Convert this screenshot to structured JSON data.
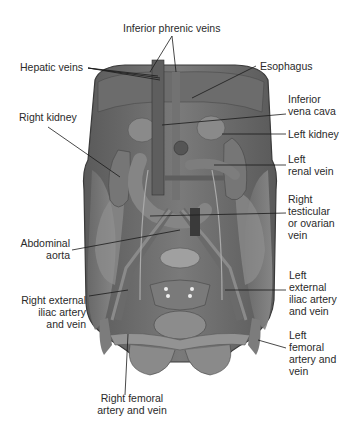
{
  "diagram": {
    "labels": [
      {
        "id": "inferior-phrenic-veins",
        "lines": [
          "Inferior phrenic veins"
        ],
        "side": "top"
      },
      {
        "id": "hepatic-veins",
        "lines": [
          "Hepatic veins"
        ],
        "side": "left"
      },
      {
        "id": "esophagus",
        "lines": [
          "Esophagus"
        ],
        "side": "right"
      },
      {
        "id": "inferior-vena-cava",
        "lines": [
          "Inferior",
          "vena cava"
        ],
        "side": "right"
      },
      {
        "id": "right-kidney",
        "lines": [
          "Right kidney"
        ],
        "side": "left"
      },
      {
        "id": "left-kidney",
        "lines": [
          "Left kidney"
        ],
        "side": "right"
      },
      {
        "id": "left-renal-vein",
        "lines": [
          "Left",
          "renal vein"
        ],
        "side": "right"
      },
      {
        "id": "right-testicular-or-ovarian-vein",
        "lines": [
          "Right",
          "testicular",
          "or ovarian",
          "vein"
        ],
        "side": "right"
      },
      {
        "id": "abdominal-aorta",
        "lines": [
          "Abdominal",
          "aorta"
        ],
        "side": "left"
      },
      {
        "id": "left-external-iliac-artery-and-vein",
        "lines": [
          "Left",
          "external",
          "iliac artery",
          "and vein"
        ],
        "side": "right"
      },
      {
        "id": "right-external-iliac-artery-and-vein",
        "lines": [
          "Right external",
          "iliac artery",
          "and vein"
        ],
        "side": "left"
      },
      {
        "id": "left-femoral-artery-and-vein",
        "lines": [
          "Left",
          "femoral",
          "artery and",
          "vein"
        ],
        "side": "right"
      },
      {
        "id": "right-femoral-artery-and-vein",
        "lines": [
          "Right femoral",
          "artery and vein"
        ],
        "side": "bottom"
      }
    ]
  },
  "colors": {
    "background": "#ffffff",
    "tissue_dark": "#4a4a4a",
    "tissue_mid": "#6e6e6e",
    "tissue_light": "#9a9a9a",
    "leader_line": "#1a1a1a",
    "text": "#2a2a2a"
  }
}
